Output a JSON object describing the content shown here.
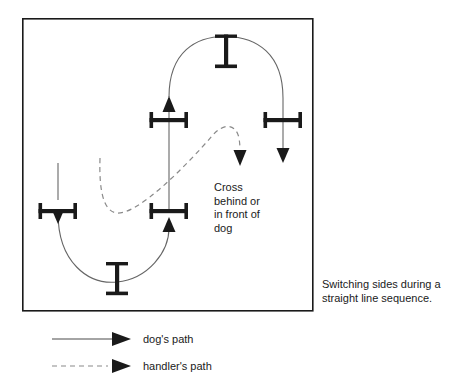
{
  "diagram": {
    "title_caption": "Switching sides during a\nstraight line sequence.",
    "annotation": "Cross\nbehind or\nin front of\ndog",
    "frame": {
      "x": 22,
      "y": 18,
      "width": 291,
      "height": 293,
      "stroke": "#1a1a1a",
      "stroke_width": 1.6
    },
    "colors": {
      "ink": "#1a1a1a",
      "dog_path": "#555555",
      "handler_path": "#777777",
      "jump": "#1a1a1a",
      "background": "#ffffff"
    },
    "obstacles": [
      {
        "name": "jump-top-vertical",
        "orientation": "vertical",
        "cx": 226,
        "cy": 51,
        "bar_length": 22,
        "post_length": 33
      },
      {
        "name": "jump-upper-left-horizontal",
        "orientation": "horizontal",
        "cx": 169,
        "cy": 120,
        "bar_length": 38,
        "post_length": 16
      },
      {
        "name": "jump-upper-right-horizontal",
        "orientation": "horizontal",
        "cx": 283,
        "cy": 120,
        "bar_length": 38,
        "post_length": 16
      },
      {
        "name": "jump-left-horizontal",
        "orientation": "horizontal",
        "cx": 58,
        "cy": 211,
        "bar_length": 38,
        "post_length": 16
      },
      {
        "name": "jump-lower-middle-horizontal",
        "orientation": "horizontal",
        "cx": 169,
        "cy": 211,
        "bar_length": 38,
        "post_length": 16
      },
      {
        "name": "jump-bottom-vertical",
        "orientation": "vertical",
        "cx": 117,
        "cy": 278,
        "bar_length": 22,
        "post_length": 33
      }
    ],
    "dog_path": {
      "style": "solid",
      "segments": [
        "M 58 163 L 58 200",
        "M 58 205 C 58 258 95 286 117 282 C 150 276 169 248 169 224",
        "M 169 218 L 169 100",
        "M 169 92 C 169 50 200 36 226 36 C 258 36 283 56 283 98",
        "M 283 98 L 283 148"
      ],
      "arrows": [
        {
          "name": "dog-arrow-left-down",
          "x": 58,
          "y": 213,
          "dir": "down"
        },
        {
          "name": "dog-arrow-middle-up",
          "x": 169,
          "y": 218,
          "dir": "up"
        },
        {
          "name": "dog-arrow-upper-up",
          "x": 169,
          "y": 97,
          "dir": "up"
        },
        {
          "name": "dog-arrow-right-down",
          "x": 283,
          "y": 160,
          "dir": "down"
        }
      ]
    },
    "handler_path": {
      "style": "dashed",
      "dash_pattern": "5,4",
      "segments": [
        "M 100 158 C 100 196 104 212 116 214 C 140 218 190 160 216 134 C 228 123 238 126 240 140 C 241 150 240 152 240 152"
      ],
      "arrows": [
        {
          "name": "handler-arrow-down",
          "x": 240,
          "y": 163,
          "dir": "down"
        }
      ]
    }
  },
  "legend": {
    "items": [
      {
        "name": "legend-dog-path",
        "label": "dog's path",
        "style": "solid",
        "icon": "arrow-right-icon"
      },
      {
        "name": "legend-handler-path",
        "label": "handler's path",
        "style": "dashed",
        "icon": "arrow-right-icon"
      }
    ],
    "geometry": {
      "dog_line": {
        "x1": 52,
        "y1": 339,
        "x2": 112,
        "y2": 339
      },
      "handler_line": {
        "x1": 52,
        "y1": 366,
        "x2": 108,
        "y2": 366
      },
      "arrow_dog": {
        "x": 118,
        "y": 339
      },
      "arrow_handler": {
        "x": 118,
        "y": 366
      }
    }
  }
}
